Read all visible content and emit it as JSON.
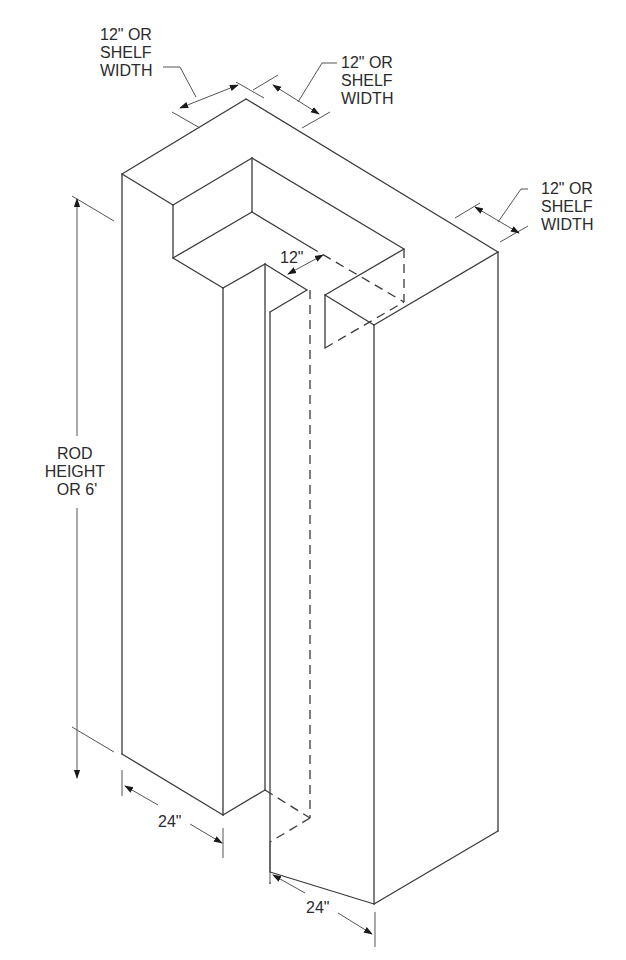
{
  "diagram": {
    "type": "isometric closet plan (L/T-shaped walk-in closet)",
    "colors": {
      "line": "#3a3a3a",
      "background": "#ffffff",
      "text": "#2b2b2b"
    },
    "labels": {
      "top_left_width": [
        "12\" OR",
        "SHELF",
        "WIDTH"
      ],
      "top_right_width": [
        "12\" OR",
        "SHELF",
        "WIDTH"
      ],
      "right_width": [
        "12\" OR",
        "SHELF",
        "WIDTH"
      ],
      "inner_gap": "12\"",
      "rod_height": [
        "ROD",
        "HEIGHT",
        "OR 6'"
      ],
      "left_depth": "24\"",
      "right_depth": "24\""
    }
  }
}
